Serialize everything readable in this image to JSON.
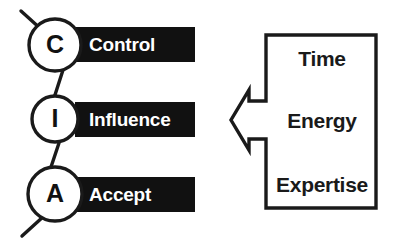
{
  "diagram": {
    "colors": {
      "bar_fill": "#111111",
      "bar_text": "#ffffff",
      "stroke": "#1a1a1a",
      "background": "#ffffff",
      "circle_fill": "#ffffff",
      "letter_color": "#111111"
    },
    "nodes": [
      {
        "letter": "C",
        "label": "Control"
      },
      {
        "letter": "I",
        "label": "Influence"
      },
      {
        "letter": "A",
        "label": "Accept"
      }
    ],
    "cost_box": {
      "items": [
        {
          "label": "Time"
        },
        {
          "label": "Energy"
        },
        {
          "label": "Expertise"
        }
      ],
      "arrow_direction": "left"
    }
  }
}
